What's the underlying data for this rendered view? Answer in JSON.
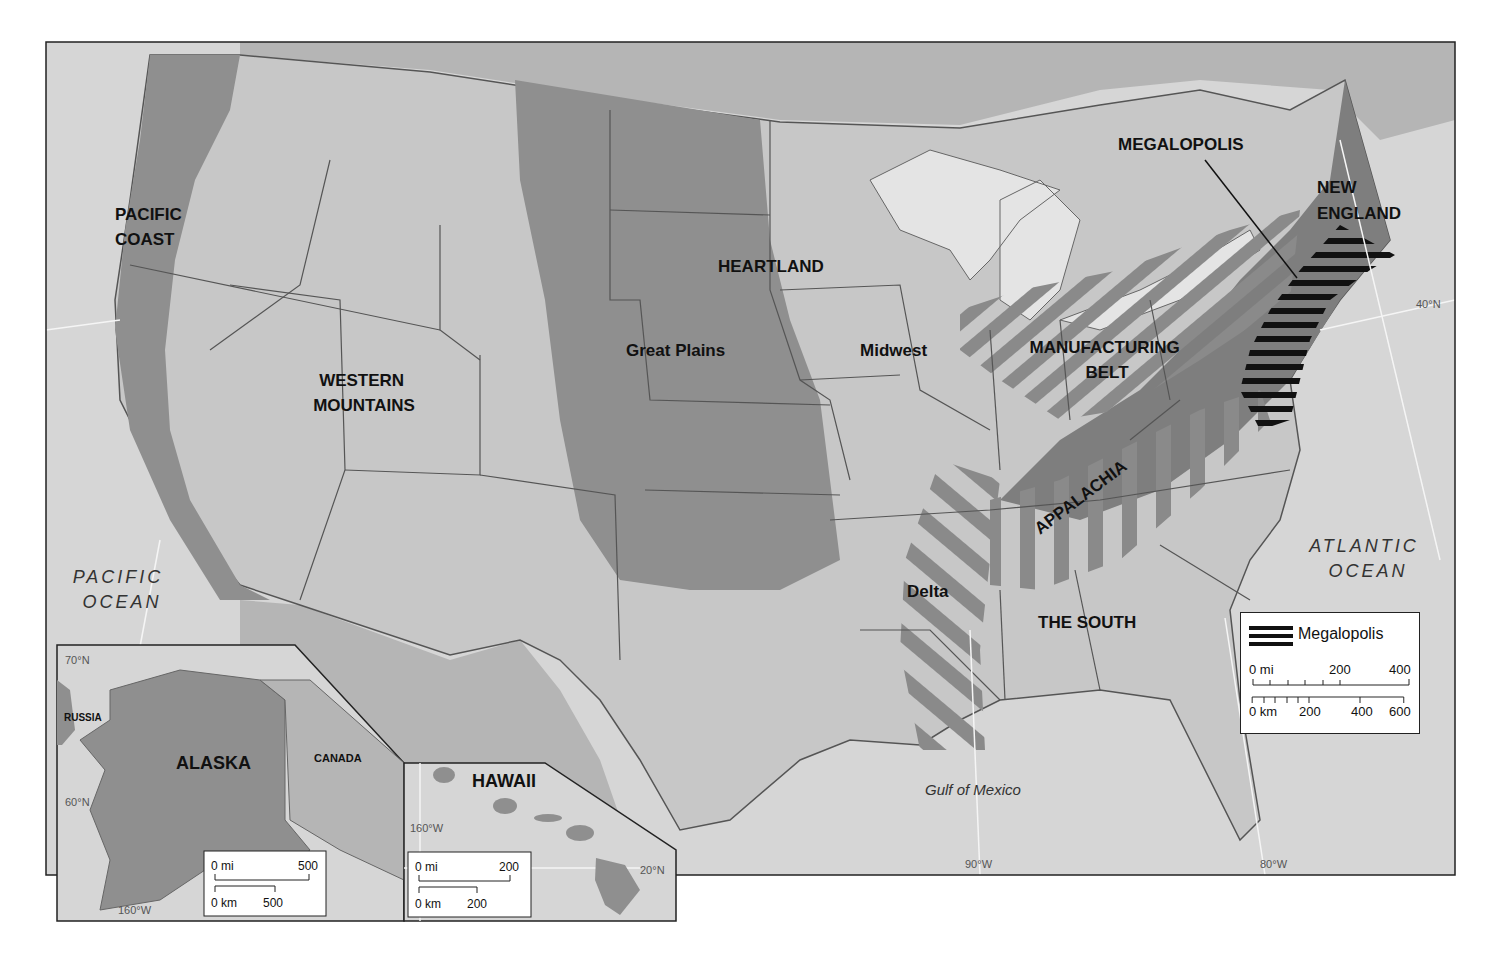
{
  "map": {
    "regions": [
      {
        "name": "PACIFIC COAST",
        "lines": [
          "PACIFIC",
          "COAST"
        ]
      },
      {
        "name": "WESTERN MOUNTAINS",
        "lines": [
          "WESTERN",
          "MOUNTAINS"
        ]
      },
      {
        "name": "HEARTLAND",
        "lines": [
          "HEARTLAND"
        ]
      },
      {
        "name": "Great Plains",
        "lines": [
          "Great Plains"
        ]
      },
      {
        "name": "Midwest",
        "lines": [
          "Midwest"
        ]
      },
      {
        "name": "MANUFACTURING BELT",
        "lines": [
          "MANUFACTURING",
          "BELT"
        ]
      },
      {
        "name": "MEGALOPOLIS",
        "lines": [
          "MEGALOPOLIS"
        ]
      },
      {
        "name": "NEW ENGLAND",
        "lines": [
          "NEW",
          "ENGLAND"
        ]
      },
      {
        "name": "APPALACHIA",
        "lines": [
          "APPALACHIA"
        ]
      },
      {
        "name": "Delta",
        "lines": [
          "Delta"
        ]
      },
      {
        "name": "THE SOUTH",
        "lines": [
          "THE SOUTH"
        ]
      }
    ],
    "water": {
      "pacific": [
        "PACIFIC",
        "OCEAN"
      ],
      "atlantic": [
        "ATLANTIC",
        "OCEAN"
      ],
      "gulf": "Gulf of Mexico"
    },
    "graticule": {
      "lat_40": "40°N",
      "lon_90": "90°W",
      "lon_80": "80°W"
    },
    "colors": {
      "background_land": "#c9c9c9",
      "ocean": "#d9d9d9",
      "region_dark": "#8f8f8f",
      "region_darker": "#7a7a7a",
      "state_border": "#555555",
      "hatch_black": "#111111"
    }
  },
  "legend": {
    "item_label": "Megalopolis",
    "mi_scale": {
      "labels": [
        "0 mi",
        "200",
        "400"
      ]
    },
    "km_scale": {
      "labels": [
        "0 km",
        "200",
        "400",
        "600"
      ]
    }
  },
  "inset_alaska": {
    "title": "ALASKA",
    "neighbors": [
      "RUSSIA",
      "CANADA"
    ],
    "lat_70": "70°N",
    "lat_60": "60°N",
    "lon_160": "160°W",
    "scale": {
      "mi": [
        "0 mi",
        "500"
      ],
      "km": [
        "0 km",
        "500"
      ]
    }
  },
  "inset_hawaii": {
    "title": "HAWAII",
    "lon_160": "160°W",
    "lat_20": "20°N",
    "scale": {
      "mi": [
        "0 mi",
        "200"
      ],
      "km": [
        "0 km",
        "200"
      ]
    }
  }
}
